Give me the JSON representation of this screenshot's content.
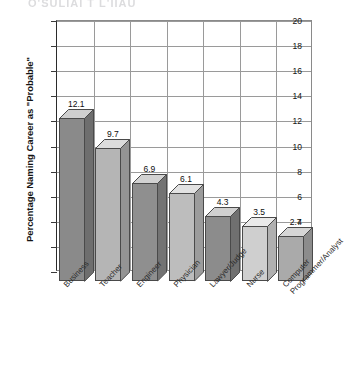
{
  "artifact_text": "Q'SULIAI  T L'IIAU",
  "chart_data": {
    "type": "bar",
    "title": "",
    "xlabel": "",
    "ylabel": "Percentage Naming Career as \"Probable\"",
    "ylim": [
      0,
      20
    ],
    "ytick_step": 2,
    "yticks": [
      "20",
      "18",
      "16",
      "14",
      "12",
      "10",
      "8",
      "6",
      "4",
      "2",
      "0"
    ],
    "grid": "both",
    "legend": "none",
    "categories": [
      "Business",
      "Teacher",
      "Engineer",
      "Physician",
      "Lawyer/Judge",
      "Nurse",
      "Computer Programmer/Analyst"
    ],
    "category_lines": [
      [
        "Business"
      ],
      [
        "Teacher"
      ],
      [
        "Engineer"
      ],
      [
        "Physician"
      ],
      [
        "Lawyer/Judge"
      ],
      [
        "Nurse"
      ],
      [
        "Computer",
        "Programmer/Analyst"
      ]
    ],
    "values": [
      12.1,
      9.7,
      6.9,
      6.1,
      4.3,
      3.5,
      2.7
    ],
    "value_labels": [
      "12.1",
      "9.7",
      "6.9",
      "6.1",
      "4.3",
      "3.5",
      "2.7"
    ],
    "bar_colors": [
      "#8a8a8a",
      "#b5b5b5",
      "#8f8f8f",
      "#bdbdbd",
      "#8c8c8c",
      "#cfcfcf",
      "#aaaaaa"
    ],
    "bar_top_colors": [
      "#cfcfcf",
      "#dcdcdc",
      "#d2d2d2",
      "#e2e2e2",
      "#d0d0d0",
      "#eaeaea",
      "#d6d6d6"
    ],
    "bar_side_colors": [
      "#6e6e6e",
      "#949494",
      "#737373",
      "#9c9c9c",
      "#707070",
      "#b0b0b0",
      "#8c8c8c"
    ],
    "axis_color": "#2b2b2b",
    "grid_color": "#9a9a9a"
  }
}
